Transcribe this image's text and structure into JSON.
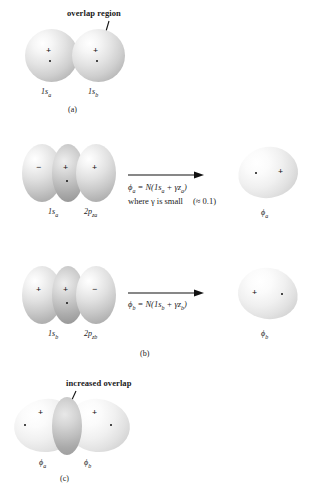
{
  "figure": {
    "background_color": "#ffffff",
    "orbital_fill": "#d8d8d8",
    "ink_color": "#1a1a1a"
  },
  "panels": [
    {
      "id": "a",
      "caption": "(a)",
      "annotation": "overlap region",
      "orbitals": [
        {
          "label": "1s",
          "subscript": "a",
          "sign": "+",
          "nucleus": true
        },
        {
          "label": "1s",
          "subscript": "b",
          "sign": "+",
          "nucleus": true
        }
      ]
    },
    {
      "id": "b1",
      "caption": "",
      "equation": "ϕa = N(1sa + γza)",
      "equation_parts": {
        "lhs": "ϕ",
        "lhs_sub": "a",
        "eq": " = ",
        "normalizer": "N",
        "open": "(1s",
        "s_sub": "a",
        "plus": " + ",
        "gamma": "γz",
        "z_sub": "a",
        "close": ")"
      },
      "note": "where γ is small",
      "note_value": "(≈ 0.1)",
      "orbitals": [
        {
          "label": "1s",
          "subscript": "a",
          "sign": "−"
        },
        {
          "label": "2p",
          "subscript": "za",
          "sign": "+"
        }
      ],
      "lobe_signs": [
        "−",
        "+",
        "+"
      ],
      "result": {
        "label": "ϕ",
        "subscript": "a",
        "sign": "+",
        "sign_side": "right",
        "nucleus_side": "left"
      }
    },
    {
      "id": "b2",
      "caption": "(b)",
      "equation": "ϕb = N(1sb + γzb)",
      "equation_parts": {
        "lhs": "ϕ",
        "lhs_sub": "b",
        "eq": " = ",
        "normalizer": "N",
        "open": "(1s",
        "s_sub": "b",
        "plus": " + ",
        "gamma": "γz",
        "z_sub": "b",
        "close": ")"
      },
      "orbitals": [
        {
          "label": "1s",
          "subscript": "b",
          "sign": "+"
        },
        {
          "label": "2p",
          "subscript": "zb",
          "sign": "−"
        }
      ],
      "lobe_signs": [
        "+",
        "+",
        "−"
      ],
      "result": {
        "label": "ϕ",
        "subscript": "b",
        "sign": "+",
        "sign_side": "left",
        "nucleus_side": "right"
      }
    },
    {
      "id": "c",
      "caption": "(c)",
      "annotation": "increased overlap",
      "orbitals": [
        {
          "label": "ϕ",
          "subscript": "a",
          "sign": "+",
          "nucleus": true
        },
        {
          "label": "ϕ",
          "subscript": "b",
          "sign": "+",
          "nucleus": true
        }
      ]
    }
  ],
  "labels": {
    "overlap_region": "overlap region",
    "increased_overlap": "increased overlap",
    "cap_a": "(a)",
    "cap_b": "(b)",
    "cap_c": "(c)",
    "one_s_a": "1s",
    "one_s_a_sub": "a",
    "one_s_b": "1s",
    "one_s_b_sub": "b",
    "two_p_za": "2p",
    "two_p_za_sub": "za",
    "two_p_zb": "2p",
    "two_p_zb_sub": "zb",
    "phi": "ϕ",
    "sub_a": "a",
    "sub_b": "b",
    "plus": "+",
    "minus": "−",
    "eq_a_lhs": "ϕ",
    "eq_a_body": " = N(1s",
    "eq_a_sub1": "a",
    "eq_a_mid": " + γz",
    "eq_a_sub2": "a",
    "eq_a_end": ")",
    "eq_b_body": " = N(1s",
    "eq_note_where": "where γ is small",
    "eq_note_value": "(≈ 0.1)"
  }
}
